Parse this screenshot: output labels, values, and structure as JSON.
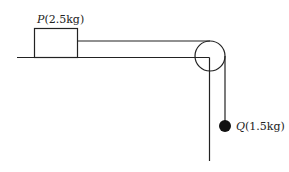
{
  "diagram": {
    "block_p": {
      "name": "P",
      "mass": "(2.5kg)"
    },
    "ball_q": {
      "name": "Q",
      "mass": "(1.5kg)"
    },
    "colors": {
      "stroke": "#222222",
      "ball": "#111111",
      "background": "#ffffff"
    }
  }
}
